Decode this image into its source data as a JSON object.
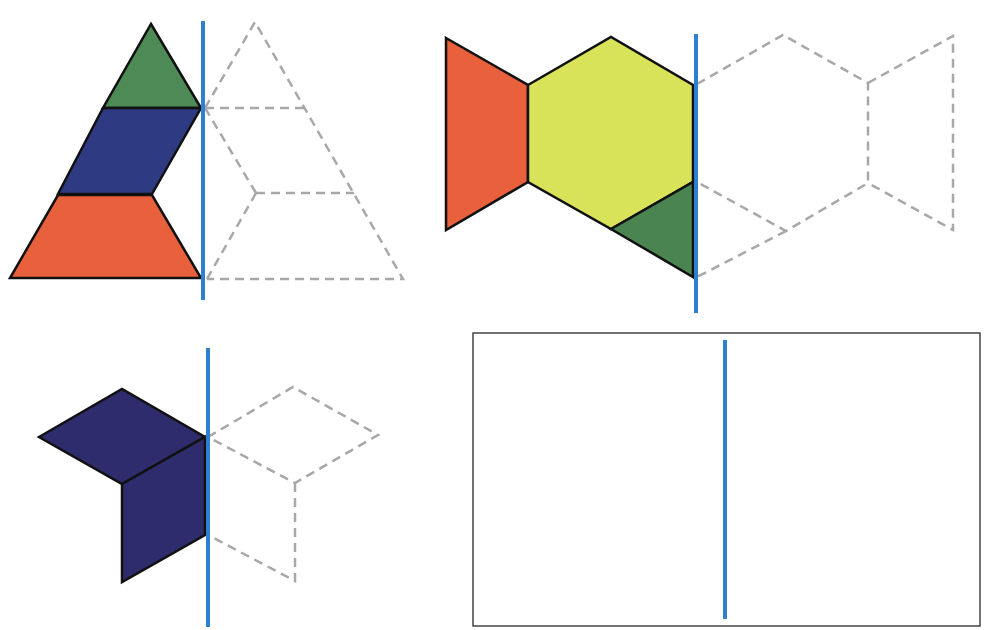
{
  "colors": {
    "orange": "#e8603c",
    "green": "#4e8a55",
    "dark_green": "#4a8450",
    "blue": "#2e3b82",
    "indigo": "#2f2c6e",
    "yellow": "#d9e35a",
    "mirror_line": "#2f7fd0",
    "dashed_outline": "#a8a8a8"
  },
  "puzzles": [
    {
      "id": "triangle-puzzle",
      "pieces": [
        {
          "shape": "triangle",
          "color": "green"
        },
        {
          "shape": "rhombus",
          "color": "blue"
        },
        {
          "shape": "trapezoid",
          "color": "orange"
        }
      ],
      "mirror": "vertical line",
      "reflection": "dashed outline"
    },
    {
      "id": "bowtie-puzzle",
      "pieces": [
        {
          "shape": "trapezoid",
          "color": "orange"
        },
        {
          "shape": "hexagon",
          "color": "yellow"
        },
        {
          "shape": "triangle",
          "color": "dark_green"
        }
      ],
      "mirror": "vertical line",
      "reflection": "dashed outline"
    },
    {
      "id": "cube-puzzle",
      "pieces": [
        {
          "shape": "rhombus",
          "color": "indigo"
        },
        {
          "shape": "rhombus",
          "color": "indigo"
        }
      ],
      "mirror": "vertical line",
      "reflection": "dashed outline"
    },
    {
      "id": "empty-puzzle",
      "pieces": [],
      "mirror": "vertical line",
      "reflection": "blank box"
    }
  ]
}
